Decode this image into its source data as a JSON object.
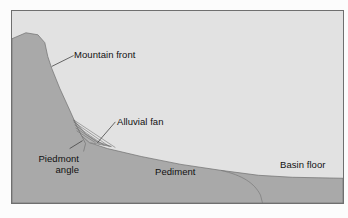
{
  "figure": {
    "type": "geologic-cross-section",
    "colors": {
      "page_background": "#fcfcfc",
      "sky_background": "#e2e2e2",
      "bedrock_fill": "#a9a9a9",
      "fan_fill": "#b4b4b4",
      "border": "#6f6f6f",
      "line": "#555555",
      "text": "#111111"
    },
    "labels": {
      "mountain_front": "Mountain front",
      "alluvial_fan": "Alluvial fan",
      "piedmont_angle_line1": "Piedmont",
      "piedmont_angle_line2": "angle",
      "pediment": "Pediment",
      "basin_floor": "Basin floor"
    }
  }
}
